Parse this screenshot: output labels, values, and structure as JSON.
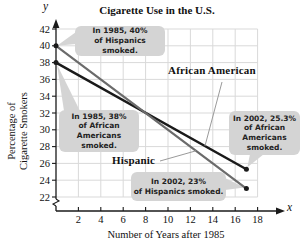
{
  "title": "Cigarette Use in the U.S.",
  "y_var": "y",
  "x_var": "x",
  "x_axis_title": "Number of Years after 1985",
  "y_axis_title_lines": [
    "Percentage of",
    "Cigarette Smokers"
  ],
  "series_labels": {
    "african_american": "African American",
    "hispanic": "Hispanic"
  },
  "callouts": [
    {
      "id": "hispanic-1985",
      "lines": [
        "In 1985, 40%",
        "of Hispanics smoked."
      ]
    },
    {
      "id": "african-american-1985",
      "lines": [
        "In 1985, 38%",
        "of African",
        "Americans smoked."
      ]
    },
    {
      "id": "african-american-2002",
      "lines": [
        "In 2002, 25.3%",
        "of African",
        "Americans smoked."
      ]
    },
    {
      "id": "hispanic-2002",
      "lines": [
        "In 2002, 23%",
        "of Hispanics smoked."
      ]
    }
  ],
  "colors": {
    "african_american_line": "#1a1a1a",
    "hispanic_line": "#6b6b6b",
    "grid": "#d9d9d9",
    "callout_bg": "#d4d4d4",
    "axis": "#1a1a1a",
    "tick_text": "#111111",
    "pointer_line": "#9a9a9a"
  },
  "chart_data": {
    "type": "line",
    "title": "Cigarette Use in the U.S.",
    "xlabel": "Number of Years after 1985",
    "ylabel": "Percentage of Cigarette Smokers",
    "x_ticks": [
      2,
      4,
      6,
      8,
      10,
      12,
      14,
      16,
      18
    ],
    "y_ticks": [
      22,
      24,
      26,
      28,
      30,
      32,
      34,
      36,
      38,
      40,
      42
    ],
    "xlim": [
      0,
      19
    ],
    "ylim": [
      22,
      42
    ],
    "grid": true,
    "axis_break_on_y": true,
    "legend_position": "inline-labels",
    "series": [
      {
        "name": "African American",
        "x": [
          0,
          17
        ],
        "values": [
          38,
          25.3
        ]
      },
      {
        "name": "Hispanic",
        "x": [
          0,
          17
        ],
        "values": [
          40,
          23
        ]
      }
    ],
    "label_pointers": [
      {
        "series": "African American",
        "at_x": 13.3
      },
      {
        "series": "Hispanic",
        "at_x": 12.5
      }
    ]
  }
}
